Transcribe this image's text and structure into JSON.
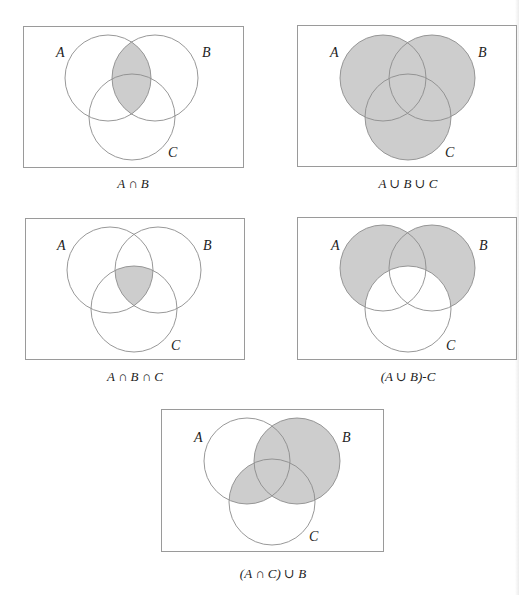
{
  "figure": {
    "shade_color": "#cdcdcd",
    "outline_color": "#8c8c8c",
    "frame_color": "#9a9a9a"
  },
  "panels": [
    {
      "id": "p1",
      "caption": "A ∩ B",
      "shaded_region": "intersection of A and B",
      "labels": {
        "a": "A",
        "b": "B",
        "c": "C"
      }
    },
    {
      "id": "p2",
      "caption": "A ∪ B ∪ C",
      "shaded_region": "union of A, B and C",
      "labels": {
        "a": "A",
        "b": "B",
        "c": "C"
      }
    },
    {
      "id": "p3",
      "caption": "A ∩ B ∩ C",
      "shaded_region": "intersection of A, B and C",
      "labels": {
        "a": "A",
        "b": "B",
        "c": "C"
      }
    },
    {
      "id": "p4",
      "caption": "(A ∪ B)-C",
      "shaded_region": "union of A and B minus C",
      "labels": {
        "a": "A",
        "b": "B",
        "c": "C"
      }
    },
    {
      "id": "p5",
      "caption": "(A ∩ C) ∪ B",
      "shaded_region": "intersection of A and C, unioned with B",
      "labels": {
        "a": "A",
        "b": "B",
        "c": "C"
      }
    }
  ]
}
